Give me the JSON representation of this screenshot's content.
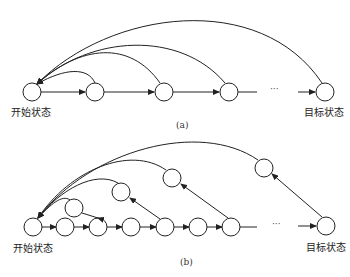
{
  "diagram_a": {
    "caption": "(a)",
    "start_label": "开始状态",
    "goal_label": "目标状态",
    "ellipsis": "···"
  },
  "diagram_b": {
    "caption": "(b)",
    "start_label": "开始状态",
    "goal_label": "目标状态",
    "ellipsis": "···"
  },
  "colors": {
    "stroke": "#222222",
    "background": "#ffffff"
  }
}
